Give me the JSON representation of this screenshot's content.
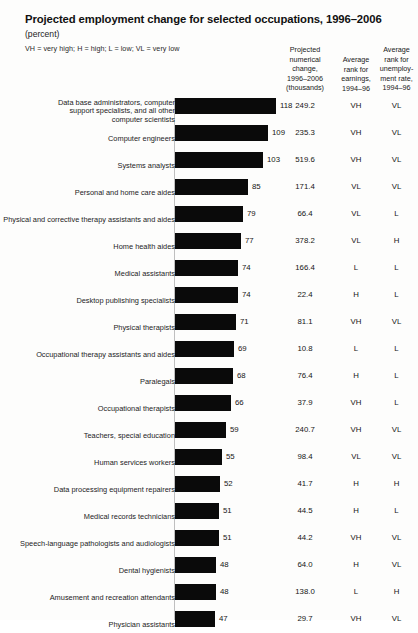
{
  "header": {
    "title": "Projected employment change for selected occupations, 1996–2006",
    "subtitle": "(percent)",
    "legend_note": "VH = very high; H = high; L = low; VL = very low",
    "columns": {
      "numerical": "Projected\nnumerical\nchange,\n1996–2006\n(thousands)",
      "earnings": "Average\nrank for\nearnings,\n1994–96",
      "unemployment": "Average\nrank for\nunemploy-\nment rate,\n1994–96"
    }
  },
  "chart_data": {
    "type": "bar",
    "orientation": "horizontal",
    "title": "Projected employment change for selected occupations, 1996–2006",
    "xlabel": "(percent)",
    "ylabel": "",
    "xlim": [
      0,
      120
    ],
    "grid": false,
    "legend": "VH = very high; H = high; L = low; VL = very low",
    "value_unit": "percent",
    "categories": [
      "Data base administrators, computer\nsupport specialists, and all other\ncomputer scientists",
      "Computer engineers",
      "Systems analysts",
      "Personal and home care aides",
      "Physical and corrective therapy assistants and aides",
      "Home health aides",
      "Medical assistants",
      "Desktop publishing specialists",
      "Physical therapists",
      "Occupational therapy assistants and aides",
      "Paralegals",
      "Occupational therapists",
      "Teachers, special education",
      "Human services workers",
      "Data processing equipment repairers",
      "Medical records technicians",
      "Speech-language pathologists and audiologists",
      "Dental hygienists",
      "Amusement and recreation attendants",
      "Physician assistants"
    ],
    "values": [
      118,
      109,
      103,
      85,
      79,
      77,
      74,
      74,
      71,
      69,
      68,
      66,
      59,
      55,
      52,
      51,
      51,
      48,
      48,
      47
    ],
    "series": [
      {
        "name": "Projected numerical change, 1996-2006 (thousands)",
        "values": [
          249.2,
          235.3,
          519.6,
          171.4,
          66.4,
          378.2,
          166.4,
          22.4,
          81.1,
          10.8,
          76.4,
          37.9,
          240.7,
          98.4,
          41.7,
          44.5,
          44.2,
          64.0,
          138.0,
          29.7
        ]
      },
      {
        "name": "Average rank for earnings, 1994-96",
        "values": [
          "VH",
          "VH",
          "VH",
          "VL",
          "VL",
          "VL",
          "L",
          "H",
          "VH",
          "L",
          "H",
          "VH",
          "VH",
          "VL",
          "H",
          "H",
          "VH",
          "H",
          "L",
          "VH"
        ]
      },
      {
        "name": "Average rank for unemployment rate, 1994-96",
        "values": [
          "VL",
          "VL",
          "VL",
          "VL",
          "L",
          "H",
          "L",
          "L",
          "VL",
          "L",
          "L",
          "L",
          "VL",
          "VL",
          "H",
          "L",
          "VL",
          "VL",
          "H",
          "VL"
        ]
      }
    ]
  },
  "rows": [
    {
      "label": "Data base administrators, computer\nsupport specialists, and all other\ncomputer scientists",
      "percent": "118",
      "numerical": "249.2",
      "earnings": "VH",
      "unemployment": "VL"
    },
    {
      "label": "Computer engineers",
      "percent": "109",
      "numerical": "235.3",
      "earnings": "VH",
      "unemployment": "VL"
    },
    {
      "label": "Systems analysts",
      "percent": "103",
      "numerical": "519.6",
      "earnings": "VH",
      "unemployment": "VL"
    },
    {
      "label": "Personal and home care aides",
      "percent": "85",
      "numerical": "171.4",
      "earnings": "VL",
      "unemployment": "VL"
    },
    {
      "label": "Physical and corrective therapy assistants and aides",
      "percent": "79",
      "numerical": "66.4",
      "earnings": "VL",
      "unemployment": "L"
    },
    {
      "label": "Home health aides",
      "percent": "77",
      "numerical": "378.2",
      "earnings": "VL",
      "unemployment": "H"
    },
    {
      "label": "Medical assistants",
      "percent": "74",
      "numerical": "166.4",
      "earnings": "L",
      "unemployment": "L"
    },
    {
      "label": "Desktop publishing specialists",
      "percent": "74",
      "numerical": "22.4",
      "earnings": "H",
      "unemployment": "L"
    },
    {
      "label": "Physical therapists",
      "percent": "71",
      "numerical": "81.1",
      "earnings": "VH",
      "unemployment": "VL"
    },
    {
      "label": "Occupational therapy assistants and aides",
      "percent": "69",
      "numerical": "10.8",
      "earnings": "L",
      "unemployment": "L"
    },
    {
      "label": "Paralegals",
      "percent": "68",
      "numerical": "76.4",
      "earnings": "H",
      "unemployment": "L"
    },
    {
      "label": "Occupational therapists",
      "percent": "66",
      "numerical": "37.9",
      "earnings": "VH",
      "unemployment": "L"
    },
    {
      "label": "Teachers, special education",
      "percent": "59",
      "numerical": "240.7",
      "earnings": "VH",
      "unemployment": "VL"
    },
    {
      "label": "Human services workers",
      "percent": "55",
      "numerical": "98.4",
      "earnings": "VL",
      "unemployment": "VL"
    },
    {
      "label": "Data processing equipment repairers",
      "percent": "52",
      "numerical": "41.7",
      "earnings": "H",
      "unemployment": "H"
    },
    {
      "label": "Medical records technicians",
      "percent": "51",
      "numerical": "44.5",
      "earnings": "H",
      "unemployment": "L"
    },
    {
      "label": "Speech-language pathologists and audiologists",
      "percent": "51",
      "numerical": "44.2",
      "earnings": "VH",
      "unemployment": "VL"
    },
    {
      "label": "Dental hygienists",
      "percent": "48",
      "numerical": "64.0",
      "earnings": "H",
      "unemployment": "VL"
    },
    {
      "label": "Amusement and recreation attendants",
      "percent": "48",
      "numerical": "138.0",
      "earnings": "L",
      "unemployment": "H"
    },
    {
      "label": "Physician assistants",
      "percent": "47",
      "numerical": "29.7",
      "earnings": "VH",
      "unemployment": "VL"
    }
  ],
  "style": {
    "bar_color": "#0a0a0a",
    "background": "#fdfdfc",
    "text_color": "#1a1a1a",
    "axis_color": "#bfbfbf"
  }
}
